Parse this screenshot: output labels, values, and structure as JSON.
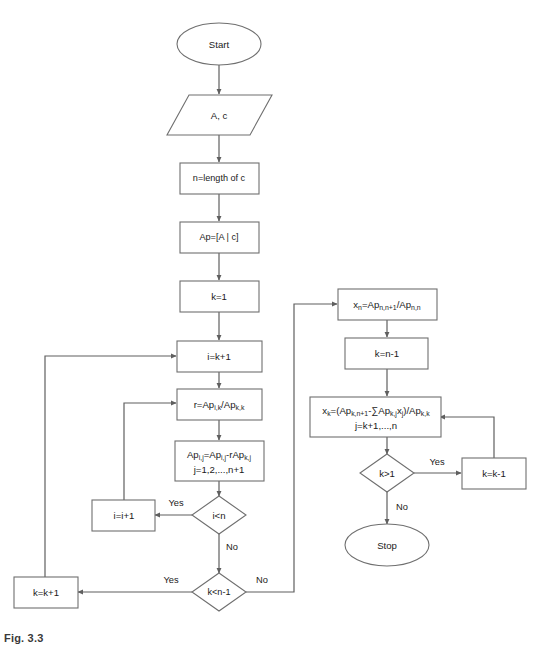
{
  "diagram": {
    "caption": "Fig. 3.3",
    "background_color": "#ffffff",
    "stroke_color": "#6f6f6f",
    "text_color": "#1a1a1a"
  },
  "nodes": {
    "start": {
      "label": "Start",
      "shape": "terminator"
    },
    "input": {
      "label": "A, c",
      "shape": "parallelogram"
    },
    "n_length": {
      "label": "n=length of c",
      "shape": "process"
    },
    "augment": {
      "label": "Ap=[A | c]",
      "shape": "process"
    },
    "k_init": {
      "label": "k=1",
      "shape": "process"
    },
    "i_init": {
      "label": "i=k+1",
      "shape": "process"
    },
    "ratio": {
      "shape": "process",
      "line1": [
        {
          "t": "r=Ap"
        },
        {
          "t": "i,k",
          "sub": true
        },
        {
          "t": "/Ap"
        },
        {
          "t": "k,k",
          "sub": true
        }
      ],
      "plain": "r=Ap_i,k/Ap_k,k"
    },
    "elim": {
      "shape": "process",
      "line1": [
        {
          "t": "Ap"
        },
        {
          "t": "i,j",
          "sub": true
        },
        {
          "t": "=Ap"
        },
        {
          "t": "i,j",
          "sub": true
        },
        {
          "t": "-rAp"
        },
        {
          "t": "k,j",
          "sub": true
        }
      ],
      "line2": [
        {
          "t": "j=1,2,...,n+1"
        }
      ],
      "plain": "Ap_i,j=Ap_i,j-rAp_k,j ; j=1,2,...,n+1"
    },
    "cond_i_lt_n": {
      "label": "i<n",
      "shape": "decision"
    },
    "i_incr": {
      "label": "i=i+1",
      "shape": "process"
    },
    "cond_k_lt_n1": {
      "label": "k<n-1",
      "shape": "decision"
    },
    "k_incr": {
      "label": "k=k+1",
      "shape": "process"
    },
    "back_xn": {
      "shape": "process",
      "line1": [
        {
          "t": "x"
        },
        {
          "t": "n",
          "sub": true
        },
        {
          "t": "=Ap"
        },
        {
          "t": "n,n+1",
          "sub": true
        },
        {
          "t": "/Ap"
        },
        {
          "t": "n,n",
          "sub": true
        }
      ],
      "plain": "x_n=Ap_n,n+1/Ap_n,n"
    },
    "k_set": {
      "label": "k=n-1",
      "shape": "process"
    },
    "back_xk": {
      "shape": "process",
      "line1": [
        {
          "t": "x"
        },
        {
          "t": "k",
          "sub": true
        },
        {
          "t": "=(Ap"
        },
        {
          "t": "k,n+1",
          "sub": true
        },
        {
          "t": "-∑Ap"
        },
        {
          "t": "k,j",
          "sub": true
        },
        {
          "t": "x"
        },
        {
          "t": "j",
          "sub": true
        },
        {
          "t": ")/Ap"
        },
        {
          "t": "k,k",
          "sub": true
        }
      ],
      "line2": [
        {
          "t": "j=k+1,...,n"
        }
      ],
      "plain": "x_k=(Ap_k,n+1-∑Ap_k,j x_j)/Ap_k,k ; j=k+1,...,n"
    },
    "cond_k_gt_1": {
      "label": "k>1",
      "shape": "decision"
    },
    "k_decr": {
      "label": "k=k-1",
      "shape": "process"
    },
    "stop": {
      "label": "Stop",
      "shape": "terminator"
    }
  },
  "edge_labels": {
    "i_lt_n_yes": "Yes",
    "i_lt_n_no": "No",
    "k_lt_n1_yes": "Yes",
    "k_lt_n1_no": "No",
    "k_gt_1_yes": "Yes",
    "k_gt_1_no": "No"
  }
}
